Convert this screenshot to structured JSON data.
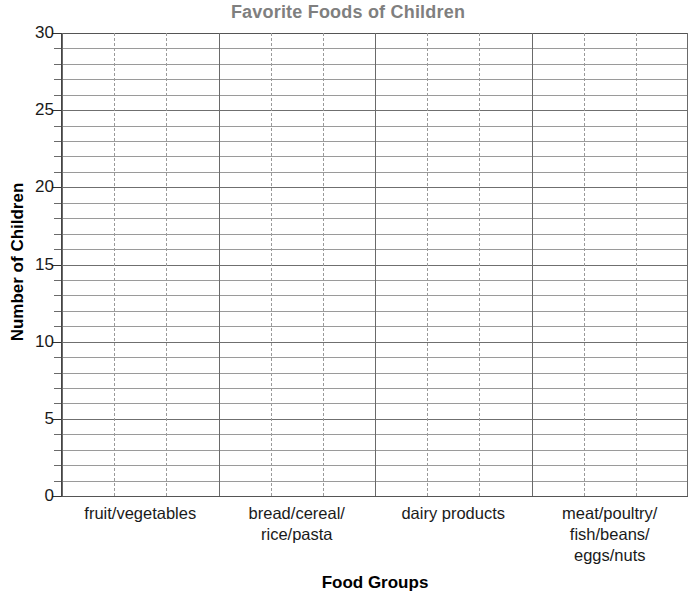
{
  "chart_data": {
    "type": "bar",
    "title": "Favorite Foods of Children",
    "xlabel": "Food Groups",
    "ylabel": "Number of Children",
    "categories": [
      "fruit/vegetables",
      "bread/cereal/\nrice/pasta",
      "dairy products",
      "meat/poultry/\nfish/beans/\neggs/nuts"
    ],
    "values": [
      null,
      null,
      null,
      null
    ],
    "ylim": [
      0,
      30
    ],
    "ytick_major_step": 5,
    "ytick_minor_step": 1,
    "ytick_labels": [
      "0",
      "5",
      "10",
      "15",
      "20",
      "25",
      "30"
    ],
    "grid": true,
    "grid_horizontal_step": 1,
    "grid_vertical_subdivisions_per_category": 3,
    "legend": null,
    "note": "empty grid template - no bars plotted"
  },
  "title": {
    "text": "Favorite Foods of Children",
    "color": "#7f7f7f"
  },
  "axes": {
    "y_title": "Number of Children",
    "x_title": "Food Groups",
    "y_ticks": [
      "30",
      "25",
      "20",
      "15",
      "10",
      "5",
      "0"
    ]
  },
  "categories": [
    {
      "line1": "fruit/vegetables",
      "line2": "",
      "line3": ""
    },
    {
      "line1": "bread/cereal/",
      "line2": "rice/pasta",
      "line3": ""
    },
    {
      "line1": "dairy products",
      "line2": "",
      "line3": ""
    },
    {
      "line1": "meat/poultry/",
      "line2": "fish/beans/",
      "line3": "eggs/nuts"
    }
  ],
  "colors": {
    "title": "#7f7f7f",
    "text": "#1a1a1a",
    "gridline": "#9a9a9a",
    "gridline_major": "#6f6f6f",
    "axis": "#444444",
    "background": "#ffffff"
  }
}
